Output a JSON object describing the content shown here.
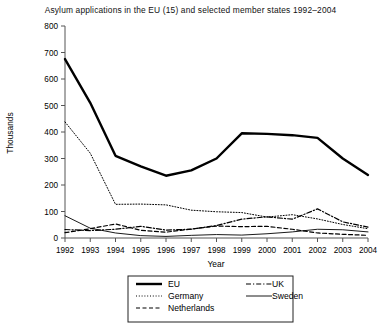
{
  "chart_data": {
    "type": "line",
    "title": "Asylum applications in the EU (15) and selected member states 1992–2004",
    "xlabel": "Year",
    "ylabel": "Thousands",
    "x": [
      1992,
      1993,
      1994,
      1995,
      1996,
      1997,
      1998,
      1999,
      2000,
      2001,
      2002,
      2003,
      2004
    ],
    "xticklabels": [
      "1992",
      "1993",
      "1994",
      "1995",
      "1996",
      "1997",
      "1998",
      "1999",
      "2000",
      "2001",
      "2002",
      "2003",
      "2004"
    ],
    "yticklabels": [
      "0",
      "100",
      "200",
      "300",
      "400",
      "500",
      "600",
      "700",
      "800"
    ],
    "ylim": [
      0,
      800
    ],
    "ytick_step": 100,
    "grid": false,
    "legend_position": "below-axes",
    "series": [
      {
        "name": "EU",
        "style": "solid-thick",
        "values": [
          675,
          510,
          310,
          270,
          235,
          255,
          300,
          395,
          393,
          388,
          378,
          300,
          238
        ]
      },
      {
        "name": "Germany",
        "style": "dotted",
        "values": [
          438,
          320,
          127,
          128,
          125,
          105,
          99,
          96,
          79,
          88,
          72,
          51,
          35
        ]
      },
      {
        "name": "Netherlands",
        "style": "dashed",
        "values": [
          20,
          35,
          53,
          29,
          22,
          34,
          45,
          43,
          44,
          33,
          19,
          14,
          10
        ]
      },
      {
        "name": "UK",
        "style": "dash-dot",
        "values": [
          32,
          28,
          33,
          44,
          30,
          33,
          47,
          71,
          80,
          71,
          110,
          61,
          41
        ]
      },
      {
        "name": "Sweden",
        "style": "solid-thin",
        "values": [
          84,
          37,
          19,
          9,
          6,
          10,
          13,
          11,
          16,
          23,
          33,
          31,
          23
        ]
      }
    ]
  },
  "legend": {
    "items": [
      {
        "label": "EU",
        "style": "solid-thick"
      },
      {
        "label": "Germany",
        "style": "dotted"
      },
      {
        "label": "Netherlands",
        "style": "dashed"
      },
      {
        "label": "UK",
        "style": "dash-dot"
      },
      {
        "label": "Sweden",
        "style": "solid-thin"
      }
    ]
  }
}
